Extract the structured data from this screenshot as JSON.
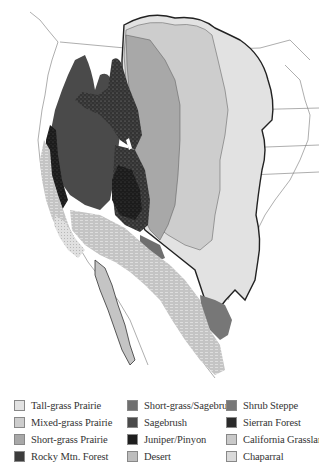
{
  "map": {
    "title": "Grassland and vegetation regions of western North America",
    "regions": [
      {
        "id": "tall-grass-prairie",
        "color": "#e2e2e2"
      },
      {
        "id": "mixed-grass-prairie",
        "color": "#cdcdcd"
      },
      {
        "id": "short-grass-prairie",
        "color": "#a8a8a8"
      },
      {
        "id": "rocky-mtn-forest",
        "color": "#3c3c3c"
      },
      {
        "id": "short-grass-sagebrush",
        "color": "#6f6f6f"
      },
      {
        "id": "sagebrush",
        "color": "#4a4a4a"
      },
      {
        "id": "juniper-pinyon",
        "color": "#1e1e1e"
      },
      {
        "id": "desert",
        "color": "#bdbdbd"
      },
      {
        "id": "shrub-steppe",
        "color": "#777777"
      },
      {
        "id": "sierran-forest",
        "color": "#2a2a2a"
      },
      {
        "id": "california-grassland",
        "color": "#c9c9c9"
      },
      {
        "id": "chaparral",
        "color": "#dadada"
      }
    ]
  },
  "legend": {
    "columns": [
      [
        {
          "label": "Tall-grass Prairie",
          "color": "#e2e2e2",
          "pattern": "solid"
        },
        {
          "label": "Mixed-grass Prairie",
          "color": "#cdcdcd",
          "pattern": "solid"
        },
        {
          "label": "Short-grass Prairie",
          "color": "#a8a8a8",
          "pattern": "solid"
        },
        {
          "label": "Rocky Mtn. Forest",
          "color": "#3c3c3c",
          "pattern": "speckled"
        }
      ],
      [
        {
          "label": "Short-grass/Sagebrush",
          "color": "#6f6f6f",
          "pattern": "solid"
        },
        {
          "label": "Sagebrush",
          "color": "#4a4a4a",
          "pattern": "solid"
        },
        {
          "label": "Juniper/Pinyon",
          "color": "#1e1e1e",
          "pattern": "speckled"
        },
        {
          "label": "Desert",
          "color": "#bdbdbd",
          "pattern": "textured"
        }
      ],
      [
        {
          "label": "Shrub  Steppe",
          "color": "#777777",
          "pattern": "solid"
        },
        {
          "label": "Sierran Forest",
          "color": "#2a2a2a",
          "pattern": "speckled"
        },
        {
          "label": "California Grassland",
          "color": "#c9c9c9",
          "pattern": "textured"
        },
        {
          "label": "Chaparral",
          "color": "#dadada",
          "pattern": "textured"
        }
      ]
    ]
  }
}
